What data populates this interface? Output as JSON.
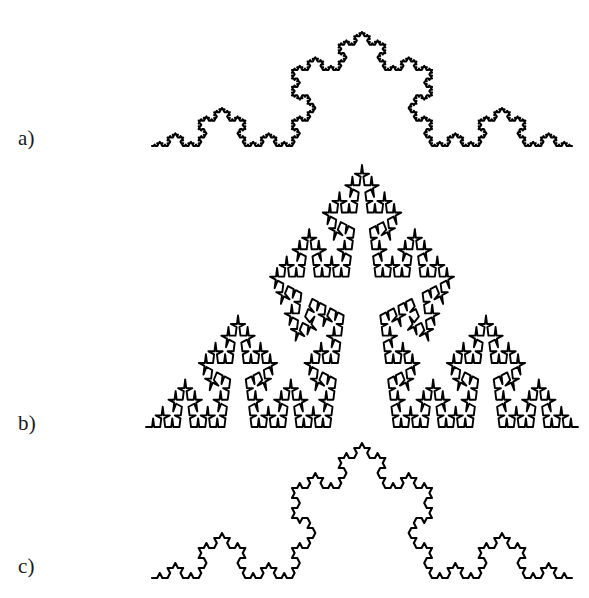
{
  "figure": {
    "background_color": "#ffffff",
    "stroke_color": "#000000",
    "width": 589,
    "height": 598,
    "caption_labels": {
      "a": "a)",
      "b": "b)",
      "c": "c)"
    }
  },
  "chart_data": {
    "type": "line",
    "title": "",
    "subtitle": "",
    "xlabel": "",
    "ylabel": "",
    "grid": false,
    "legend_position": "none",
    "panels": [
      {
        "id": "a",
        "label": "a)",
        "curve_name": "Koch curve",
        "generator_angle_deg": 60,
        "iterations": 5,
        "stroke_width": 2.1,
        "baseline_y": 146,
        "start_x": 152,
        "end_x": 572,
        "apex_x": 362,
        "apex_y": 32,
        "base_length": 420,
        "height": 114,
        "segments": 1024
      },
      {
        "id": "b",
        "label": "b)",
        "curve_name": "Steep Koch curve",
        "generator_angle_deg": 80,
        "iterations": 5,
        "stroke_width": 1.9,
        "baseline_y": 427,
        "start_x": 146,
        "end_x": 578,
        "apex_x": 362,
        "apex_y": 165,
        "base_length": 432,
        "height": 262,
        "segments": 1024
      },
      {
        "id": "c",
        "label": "c)",
        "curve_name": "Koch curve",
        "generator_angle_deg": 60,
        "iterations": 4,
        "stroke_width": 2.1,
        "baseline_y": 578,
        "start_x": 152,
        "end_x": 572,
        "apex_x": 362,
        "apex_y": 443,
        "base_length": 420,
        "height": 135,
        "segments": 256
      }
    ]
  }
}
